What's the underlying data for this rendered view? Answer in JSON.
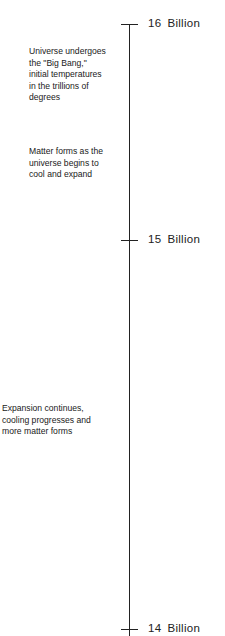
{
  "timeline": {
    "ticks": [
      {
        "value": "16",
        "unit": "Billion"
      },
      {
        "value": "15",
        "unit": "Billion"
      },
      {
        "value": "14",
        "unit": "Billion"
      }
    ],
    "events": [
      {
        "lines": [
          "Universe undergoes",
          "the \"Big Bang,\"",
          "initial temperatures",
          "in the trillions of",
          "degrees"
        ]
      },
      {
        "lines": [
          "Matter forms as the",
          "universe begins to",
          "cool and expand"
        ]
      },
      {
        "lines": [
          "Expansion continues,",
          "cooling progresses and",
          "more matter forms"
        ]
      }
    ]
  }
}
